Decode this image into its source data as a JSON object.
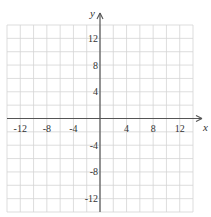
{
  "chart_data": {
    "type": "scatter",
    "title": "",
    "xlabel": "x",
    "ylabel": "y",
    "xlim": [
      -14,
      14
    ],
    "ylim": [
      -14,
      14
    ],
    "grid": true,
    "grid_step": 2,
    "x_ticks": [
      -12,
      -8,
      -4,
      4,
      8,
      12
    ],
    "y_ticks": [
      12,
      8,
      4,
      -4,
      -8,
      -12
    ],
    "x_tick_labels": [
      "-12",
      "-8",
      "-4",
      "4",
      "8",
      "12"
    ],
    "y_tick_labels": [
      "12",
      "8",
      "4",
      "-4",
      "-8",
      "-12"
    ],
    "series": []
  }
}
